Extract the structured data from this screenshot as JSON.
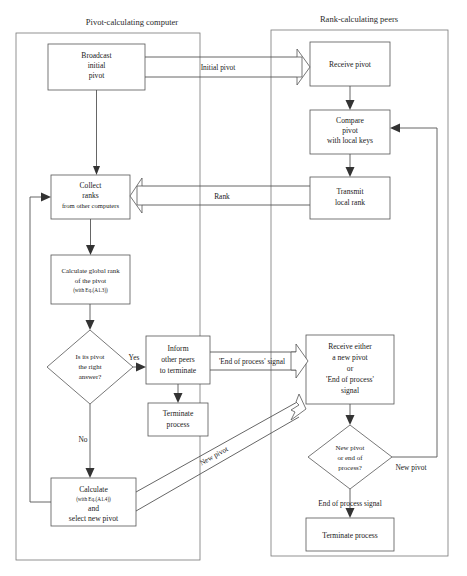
{
  "diagram": {
    "lanes": [
      {
        "id": "pivot-lane",
        "title": "Pivot-calculating computer"
      },
      {
        "id": "rank-lane",
        "title": "Rank-calculating peers"
      }
    ],
    "nodes": {
      "broadcast": {
        "lines": [
          "Broadcast",
          "initial",
          "pivot"
        ]
      },
      "collect": {
        "lines": [
          "Collect",
          "ranks",
          "from other computers"
        ]
      },
      "calc_global": {
        "lines": [
          "Calculate global rank",
          "of the pivot"
        ],
        "note": "(with Eq.(A1.3))"
      },
      "decision_pivot": {
        "lines": [
          "Is its pivot",
          "the right",
          "answer?"
        ]
      },
      "inform": {
        "lines": [
          "Inform",
          "other peers",
          "to terminate"
        ]
      },
      "terminate_left": {
        "lines": [
          "Terminate",
          "process"
        ]
      },
      "calc_new": {
        "lines": [
          "Calculate",
          "and",
          "select new pivot"
        ],
        "note": "(with Eq.(A1.4))"
      },
      "receive_pivot": {
        "lines": [
          "Receive pivot"
        ]
      },
      "compare": {
        "lines": [
          "Compare",
          "pivot",
          "with local keys"
        ]
      },
      "transmit": {
        "lines": [
          "Transmit",
          "local rank"
        ]
      },
      "receive_either": {
        "lines": [
          "Receive either",
          "a new pivot",
          "or",
          "'End of process'",
          "signal"
        ]
      },
      "decision_new": {
        "lines": [
          "New pivot",
          "or end of",
          "process?"
        ]
      },
      "terminate_right": {
        "lines": [
          "Terminate process"
        ]
      }
    },
    "edge_labels": {
      "initial_pivot": "Initial pivot",
      "rank": "Rank",
      "end_of_process": "'End of process'  signal",
      "new_pivot_diag": "New pivot",
      "new_pivot_branch": "New pivot",
      "end_of_process_signal": "End of process signal",
      "yes": "Yes",
      "no": "No"
    },
    "colors": {
      "stroke": "#555555",
      "lane_stroke": "#777777",
      "text": "#1a1a1a",
      "background": "#ffffff"
    }
  }
}
